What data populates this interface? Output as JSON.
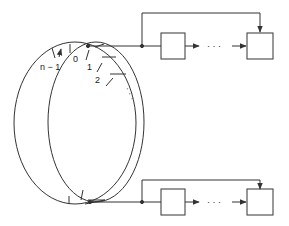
{
  "diagram": {
    "type": "hashed timing wheel with bucket lists",
    "ring": {
      "labels": {
        "slot_n_minus_1": "n − 1",
        "slot_0": "0",
        "slot_1": "1",
        "slot_2": "2",
        "continuation": "· · ·"
      }
    },
    "top_chain": {
      "nodes": [
        "",
        ""
      ],
      "ellipsis": "· · ·"
    },
    "bottom_chain": {
      "nodes": [
        "",
        ""
      ],
      "ellipsis": "· · ·"
    },
    "colors": {
      "stroke": "#333333",
      "background": "#ffffff"
    }
  }
}
